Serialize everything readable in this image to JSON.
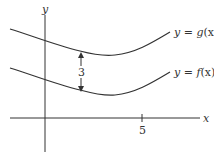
{
  "diagram": {
    "axes": {
      "x_label": "x",
      "y_label": "y",
      "x_tick_value": "5"
    },
    "curves": [
      {
        "name": "g",
        "label_prefix": "y = ",
        "label_func": "g",
        "label_arg": "(x)",
        "label": "y = g(x)"
      },
      {
        "name": "f",
        "label_prefix": "y = ",
        "label_func": "f",
        "label_arg": "(x)",
        "label": "y = f(x)"
      }
    ],
    "gap": {
      "label": "3",
      "description": "vertical distance between g(x) and f(x)"
    },
    "colors": {
      "line": "#333333",
      "background": "#ffffff"
    }
  }
}
